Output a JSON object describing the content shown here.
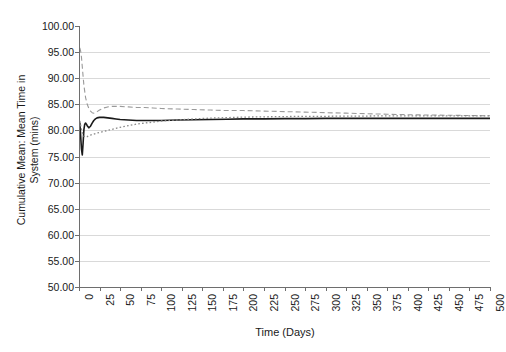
{
  "chart_data": {
    "type": "line",
    "title": "",
    "xlabel": "Time (Days)",
    "ylabel": "Cumulative Mean: Mean Time in\nSystem (mins)",
    "xlim": [
      0,
      500
    ],
    "ylim": [
      50.0,
      100.0
    ],
    "ytick_step": 5.0,
    "xtick_step": 25,
    "grid": true,
    "legend": "none",
    "background": "#ffffff",
    "gridline_color": "#d9d9d9",
    "axis_color": "#6e6e6e",
    "y_tick_labels": [
      "100.00",
      "95.00",
      "90.00",
      "85.00",
      "80.00",
      "75.00",
      "70.00",
      "65.00",
      "60.00",
      "55.00",
      "50.00"
    ],
    "y_tick_values": [
      100.0,
      95.0,
      90.0,
      85.0,
      80.0,
      75.0,
      70.0,
      65.0,
      60.0,
      55.0,
      50.0
    ],
    "x_tick_labels": [
      "0",
      "25",
      "50",
      "75",
      "100",
      "125",
      "150",
      "175",
      "200",
      "225",
      "250",
      "275",
      "300",
      "325",
      "350",
      "375",
      "400",
      "425",
      "450",
      "475",
      "500"
    ],
    "x_tick_values": [
      0,
      25,
      50,
      75,
      100,
      125,
      150,
      175,
      200,
      225,
      250,
      275,
      300,
      325,
      350,
      375,
      400,
      425,
      450,
      475,
      500
    ],
    "series": [
      {
        "name": "replication-dashed",
        "style": "dashed",
        "color": "#9a9a9a",
        "width": 1.1,
        "x": [
          1,
          2,
          3,
          4,
          5,
          6,
          8,
          10,
          12,
          14,
          16,
          18,
          20,
          22,
          25,
          30,
          35,
          40,
          45,
          50,
          60,
          70,
          80,
          90,
          100,
          120,
          140,
          160,
          180,
          200,
          225,
          250,
          275,
          300,
          325,
          350,
          375,
          400,
          425,
          450,
          475,
          500
        ],
        "values": [
          95.8,
          95.2,
          94.0,
          92.2,
          90.3,
          88.6,
          86.3,
          85.0,
          84.2,
          83.7,
          83.4,
          83.3,
          83.4,
          83.6,
          83.9,
          84.3,
          84.5,
          84.6,
          84.6,
          84.6,
          84.5,
          84.4,
          84.4,
          84.3,
          84.2,
          84.1,
          84.0,
          83.9,
          83.8,
          83.8,
          83.7,
          83.6,
          83.5,
          83.4,
          83.3,
          83.2,
          83.1,
          83.0,
          82.95,
          82.9,
          82.85,
          82.8
        ]
      },
      {
        "name": "replication-solid",
        "style": "solid",
        "color": "#1a1a1a",
        "width": 1.6,
        "x": [
          1,
          2,
          3,
          4,
          5,
          6,
          7,
          8,
          9,
          10,
          12,
          14,
          16,
          18,
          20,
          22,
          25,
          30,
          35,
          40,
          45,
          50,
          60,
          70,
          80,
          90,
          100,
          120,
          140,
          160,
          180,
          200,
          225,
          250,
          275,
          300,
          325,
          350,
          375,
          400,
          425,
          450,
          475,
          500
        ],
        "values": [
          81.5,
          79.0,
          76.4,
          75.3,
          77.6,
          80.2,
          81.2,
          81.4,
          81.2,
          80.9,
          80.5,
          80.8,
          81.4,
          81.9,
          82.2,
          82.4,
          82.5,
          82.5,
          82.4,
          82.3,
          82.2,
          82.1,
          82.0,
          81.9,
          81.9,
          81.9,
          81.9,
          82.0,
          82.05,
          82.1,
          82.15,
          82.2,
          82.2,
          82.25,
          82.25,
          82.3,
          82.3,
          82.3,
          82.3,
          82.3,
          82.3,
          82.3,
          82.3,
          82.3
        ]
      },
      {
        "name": "replication-dotted",
        "style": "dotted",
        "color": "#8a8a8a",
        "width": 1.3,
        "x": [
          1,
          2,
          3,
          4,
          5,
          6,
          8,
          10,
          12,
          14,
          16,
          18,
          20,
          22,
          25,
          30,
          35,
          40,
          45,
          50,
          60,
          70,
          80,
          90,
          100,
          120,
          140,
          160,
          180,
          200,
          225,
          250,
          275,
          300,
          325,
          350,
          375,
          400,
          425,
          450,
          475,
          500
        ],
        "values": [
          81.8,
          81.0,
          80.2,
          79.6,
          79.2,
          78.9,
          78.7,
          78.8,
          79.0,
          79.1,
          79.2,
          79.3,
          79.4,
          79.5,
          79.6,
          79.8,
          80.0,
          80.2,
          80.4,
          80.6,
          80.9,
          81.2,
          81.4,
          81.6,
          81.8,
          82.0,
          82.2,
          82.35,
          82.45,
          82.55,
          82.6,
          82.65,
          82.7,
          82.7,
          82.75,
          82.75,
          82.8,
          82.8,
          82.8,
          82.8,
          82.8,
          82.8
        ]
      }
    ]
  },
  "axes": {
    "x_title": "Time (Days)",
    "y_title_line1": "Cumulative Mean: Mean Time in",
    "y_title_line2": "System (mins)"
  },
  "caption": {
    "text": ""
  }
}
